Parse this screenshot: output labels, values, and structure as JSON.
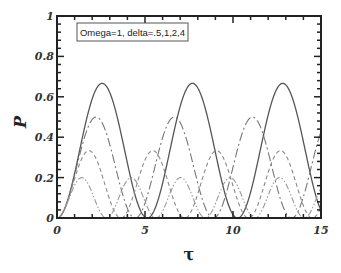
{
  "chart_data": {
    "type": "line",
    "title": "",
    "annotation": "Omega=1, delta=.5,1,2,4",
    "xlabel": "τ",
    "ylabel": "P",
    "xlim": [
      0,
      15
    ],
    "ylim": [
      0,
      1
    ],
    "grid": false,
    "legend_position": "top-left (text box)",
    "x_ticks": [
      "0",
      "5",
      "10",
      "15"
    ],
    "y_ticks": [
      "0",
      "0.2",
      "0.4",
      "0.6",
      "0.8",
      "1"
    ],
    "x": [
      0,
      1,
      2,
      3,
      4,
      5,
      6,
      7,
      8,
      9,
      10,
      11,
      12,
      13,
      14,
      15
    ],
    "series": [
      {
        "name": "delta=.5",
        "style": "solid",
        "delta": 0.5,
        "peak": 0.667,
        "values": [
          0,
          0.221,
          0.591,
          0.62,
          0.277,
          0.004,
          0.172,
          0.549,
          0.644,
          0.321,
          0.017,
          0.13,
          0.508,
          0.659,
          0.373,
          0.034
        ]
      },
      {
        "name": "delta=1",
        "style": "dash-dot",
        "delta": 1,
        "peak": 0.5,
        "values": [
          0,
          0.211,
          0.488,
          0.365,
          0.048,
          0.074,
          0.394,
          0.472,
          0.17,
          0.003,
          0.248,
          0.498,
          0.327,
          0.028,
          0.102,
          0.423
        ]
      },
      {
        "name": "delta=2",
        "style": "dashed",
        "delta": 2,
        "peak": 0.333,
        "values": [
          0,
          0.193,
          0.325,
          0.088,
          0.033,
          0.287,
          0.262,
          0.016,
          0.123,
          0.333,
          0.164,
          0.005,
          0.217,
          0.312,
          0.064,
          0.054
        ]
      },
      {
        "name": "delta=4",
        "style": "dash-dot-dot",
        "delta": 4,
        "peak": 0.2,
        "values": [
          0,
          0.162,
          0.123,
          0.009,
          0.188,
          0.083,
          0.034,
          0.2,
          0.045,
          0.074,
          0.189,
          0.013,
          0.119,
          0.165,
          0.0,
          0.153
        ]
      }
    ]
  },
  "render": {
    "plot": {
      "left": 57,
      "top": 16,
      "right": 321,
      "bottom": 218
    },
    "colors": {
      "axis": "#222222",
      "series": [
        "#555555",
        "#777777",
        "#8a8a8a",
        "#9a9a9a"
      ]
    },
    "dash": [
      "",
      "9,3,2,3",
      "4,3",
      "6,2,1.5,2,1.5,2"
    ]
  }
}
